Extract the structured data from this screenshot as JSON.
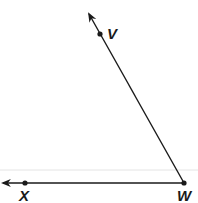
{
  "diagram": {
    "type": "angle",
    "name": "angle VWX",
    "colors": {
      "line": "#1a1a1a",
      "faint_rule": "#e4e4e4",
      "background": "#ffffff"
    },
    "points": [
      {
        "label": "V",
        "x": 100,
        "y": 34
      },
      {
        "label": "W",
        "x": 184,
        "y": 183
      },
      {
        "label": "X",
        "x": 25,
        "y": 183
      }
    ],
    "rays": [
      {
        "name": "ray WV",
        "from": "W",
        "through": "V",
        "arrow_end": {
          "x": 88,
          "y": 12
        }
      },
      {
        "name": "ray WX",
        "from": "W",
        "through": "X",
        "arrow_end": {
          "x": 2,
          "y": 183
        }
      }
    ],
    "labels": {
      "v": "V",
      "w": "W",
      "x": "X"
    }
  }
}
